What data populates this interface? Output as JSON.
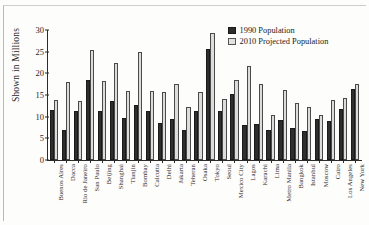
{
  "chart_data": {
    "type": "bar",
    "title": "",
    "xlabel": "",
    "ylabel": "Shown in Millions",
    "ylim": [
      0,
      30
    ],
    "yticks": [
      0,
      5,
      10,
      15,
      20,
      25,
      30
    ],
    "grid": false,
    "legend_position": "top-right",
    "categories": [
      "Buenos Aires",
      "Dacca",
      "Rio de Janeiro",
      "San Paulo",
      "Beijing",
      "Shanghai",
      "Tianjin",
      "Bombay",
      "Calcutta",
      "Delhi",
      "Jakarta",
      "Teheran",
      "Osaka",
      "Tokyo",
      "Seoul",
      "Mexico City",
      "Lagos",
      "Karachi",
      "Lima",
      "Metro Manila",
      "Bangkok",
      "Istanbul",
      "Moscow",
      "Cairo",
      "Los Angeles",
      "New York"
    ],
    "series": [
      {
        "name": "1990 Population",
        "color": "#2e2e2e",
        "values": [
          11.6,
          7.0,
          11.3,
          18.4,
          11.2,
          13.7,
          9.6,
          12.6,
          11.2,
          8.5,
          9.5,
          6.9,
          11.2,
          25.6,
          11.4,
          15.3,
          8.1,
          8.4,
          6.9,
          9.3,
          7.4,
          6.8,
          9.4,
          9.1,
          11.8,
          16.5
        ]
      },
      {
        "name": "2010 Projected Population",
        "color": "#dcdcdc",
        "values": [
          13.8,
          17.9,
          13.6,
          25.4,
          18.3,
          22.3,
          15.9,
          25.0,
          15.9,
          15.7,
          17.5,
          12.2,
          15.8,
          29.2,
          14.1,
          18.5,
          21.6,
          17.5,
          10.5,
          16.2,
          13.1,
          12.2,
          10.5,
          13.8,
          14.3,
          17.5
        ]
      }
    ]
  },
  "axis": {
    "y_title": "Shown in Millions"
  },
  "legend": {
    "entries": [
      {
        "label": "1990 Population",
        "swatch": "dark-swatch-icon"
      },
      {
        "label": "2010 Projected Population",
        "swatch": "light-swatch-icon"
      }
    ]
  }
}
